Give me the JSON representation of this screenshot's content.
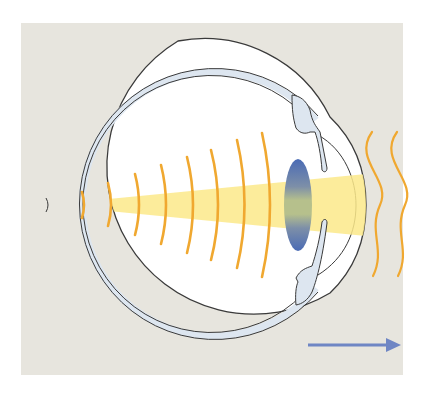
{
  "diagram": {
    "colors": {
      "page_background": "#ffffff",
      "panel_background": "#e7e5de",
      "eye_fill": "#ffffff",
      "sclera_band": "#dde6f0",
      "outline": "#3a3a3a",
      "light_cone": "#fbe98a",
      "wave_arcs": "#f0a830",
      "lens_blue": "#4a6bb5",
      "lens_center": "#b9c38a",
      "arrow": "#6f86c4"
    },
    "elements": {
      "panel": "Background panel",
      "eyeball": "Eyeball globe",
      "cornea": "Cornea",
      "lens": "Lens",
      "iris_upper": "Iris / ciliary body (upper)",
      "iris_lower": "Iris / ciliary body (lower)",
      "light_cone": "Converging beam",
      "internal_waves": "Internal wave fronts",
      "external_waves": "Incoming waves",
      "direction_arrow": "Direction arrow"
    },
    "internal_wave_count": 8,
    "external_wave_count": 2
  }
}
